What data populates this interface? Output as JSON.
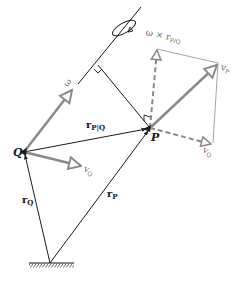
{
  "diagram": {
    "points": {
      "P": {
        "label": "P",
        "x": 150,
        "y": 128
      },
      "Q": {
        "label": "Q",
        "x": 24,
        "y": 152
      },
      "ground": {
        "x": 50,
        "y": 263
      }
    },
    "vectors": {
      "r_Q": {
        "label": "r",
        "sub": "Q"
      },
      "r_P": {
        "label": "r",
        "sub": "P"
      },
      "r_PQ": {
        "label": "r",
        "sub": "P|Q"
      },
      "omega": {
        "label": "ω"
      },
      "v_P": {
        "label": "v",
        "sub": "P"
      },
      "v_Q_at_Q": {
        "label": "v",
        "sub": "Q"
      },
      "v_Q_at_P": {
        "label": "v",
        "sub": "Q"
      },
      "omega_cross_r": {
        "label": "ω × r",
        "sub": "P/Q"
      }
    },
    "colors": {
      "line": "#1a1a1a",
      "vector_gray": "#8a8a8a",
      "thin_gray": "#9a9a9a",
      "background": "#ffffff"
    }
  }
}
